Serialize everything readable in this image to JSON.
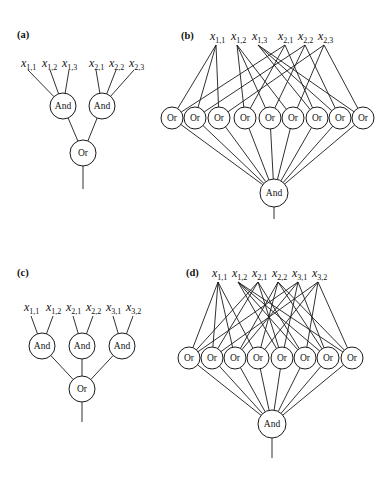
{
  "colors": {
    "stroke": "#1a1a1a",
    "background": "#ffffff"
  },
  "panels": [
    {
      "id": "a",
      "label": "(a)",
      "label_pos": [
        17,
        38
      ],
      "variables": [
        {
          "name": "x",
          "sub": "1,1",
          "text_x": 21,
          "text_y": 67,
          "anchor": [
            28,
            70
          ]
        },
        {
          "name": "x",
          "sub": "1,2",
          "text_x": 42,
          "text_y": 67,
          "anchor": [
            50,
            70
          ]
        },
        {
          "name": "x",
          "sub": "1,3",
          "text_x": 62,
          "text_y": 67,
          "anchor": [
            69,
            70
          ]
        },
        {
          "name": "x",
          "sub": "2,1",
          "text_x": 89,
          "text_y": 67,
          "anchor": [
            96,
            70
          ]
        },
        {
          "name": "x",
          "sub": "2,2",
          "text_x": 109,
          "text_y": 67,
          "anchor": [
            116,
            70
          ]
        },
        {
          "name": "x",
          "sub": "2,3",
          "text_x": 129,
          "text_y": 67,
          "anchor": [
            134,
            70
          ]
        }
      ],
      "middle": {
        "label": "And",
        "r": 13,
        "y": 106,
        "xs": [
          63,
          102
        ]
      },
      "middle_inputs": [
        [
          0,
          1,
          2
        ],
        [
          3,
          4,
          5
        ]
      ],
      "root": {
        "label": "Or",
        "r": 13,
        "x": 83,
        "y": 153,
        "stem_end": 189
      }
    },
    {
      "id": "b",
      "label": "(b)",
      "label_pos": [
        181,
        39
      ],
      "variables": [
        {
          "name": "x",
          "sub": "1,1",
          "text_x": 210,
          "text_y": 40,
          "anchor": [
            216,
            45
          ]
        },
        {
          "name": "x",
          "sub": "1,2",
          "text_x": 231,
          "text_y": 40,
          "anchor": [
            237,
            45
          ]
        },
        {
          "name": "x",
          "sub": "1,3",
          "text_x": 252,
          "text_y": 40,
          "anchor": [
            258,
            45
          ]
        },
        {
          "name": "x",
          "sub": "2,1",
          "text_x": 278,
          "text_y": 40,
          "anchor": [
            285,
            45
          ]
        },
        {
          "name": "x",
          "sub": "2,2",
          "text_x": 298,
          "text_y": 40,
          "anchor": [
            305,
            45
          ]
        },
        {
          "name": "x",
          "sub": "2,3",
          "text_x": 318,
          "text_y": 40,
          "anchor": [
            324,
            45
          ]
        }
      ],
      "middle": {
        "label": "Or",
        "r": 11,
        "y": 118,
        "xs": [
          172,
          195,
          219,
          245,
          270,
          293,
          317,
          340,
          363
        ]
      },
      "middle_inputs": [
        [
          0,
          3
        ],
        [
          0,
          4
        ],
        [
          0,
          5
        ],
        [
          1,
          3
        ],
        [
          1,
          4
        ],
        [
          1,
          5
        ],
        [
          2,
          3
        ],
        [
          2,
          4
        ],
        [
          2,
          5
        ]
      ],
      "root": {
        "label": "And",
        "r": 14,
        "x": 274,
        "y": 193,
        "stem_end": 219
      }
    },
    {
      "id": "c",
      "label": "(c)",
      "label_pos": [
        17,
        276
      ],
      "variables": [
        {
          "name": "x",
          "sub": "1,1",
          "text_x": 24,
          "text_y": 311,
          "anchor": [
            31,
            316
          ]
        },
        {
          "name": "x",
          "sub": "1,2",
          "text_x": 46,
          "text_y": 311,
          "anchor": [
            53,
            316
          ]
        },
        {
          "name": "x",
          "sub": "2,1",
          "text_x": 66,
          "text_y": 311,
          "anchor": [
            73,
            316
          ]
        },
        {
          "name": "x",
          "sub": "2,2",
          "text_x": 86,
          "text_y": 311,
          "anchor": [
            93,
            316
          ]
        },
        {
          "name": "x",
          "sub": "3,1",
          "text_x": 106,
          "text_y": 311,
          "anchor": [
            113,
            316
          ]
        },
        {
          "name": "x",
          "sub": "3,2",
          "text_x": 126,
          "text_y": 311,
          "anchor": [
            133,
            316
          ]
        }
      ],
      "middle": {
        "label": "And",
        "r": 13,
        "y": 346,
        "xs": [
          42,
          82,
          122
        ]
      },
      "middle_inputs": [
        [
          0,
          1
        ],
        [
          2,
          3
        ],
        [
          4,
          5
        ]
      ],
      "root": {
        "label": "Or",
        "r": 13,
        "x": 82,
        "y": 389,
        "stem_end": 422
      }
    },
    {
      "id": "d",
      "label": "(d)",
      "label_pos": [
        186,
        276
      ],
      "variables": [
        {
          "name": "x",
          "sub": "1,1",
          "text_x": 212,
          "text_y": 277,
          "anchor": [
            218,
            282
          ]
        },
        {
          "name": "x",
          "sub": "1,2",
          "text_x": 232,
          "text_y": 277,
          "anchor": [
            238,
            282
          ]
        },
        {
          "name": "x",
          "sub": "2,1",
          "text_x": 252,
          "text_y": 277,
          "anchor": [
            258,
            282
          ]
        },
        {
          "name": "x",
          "sub": "2,2",
          "text_x": 272,
          "text_y": 277,
          "anchor": [
            278,
            282
          ]
        },
        {
          "name": "x",
          "sub": "3,1",
          "text_x": 292,
          "text_y": 277,
          "anchor": [
            298,
            282
          ]
        },
        {
          "name": "x",
          "sub": "3,2",
          "text_x": 312,
          "text_y": 277,
          "anchor": [
            318,
            282
          ]
        }
      ],
      "middle": {
        "label": "Or",
        "r": 11,
        "y": 358,
        "xs": [
          189,
          212,
          235,
          258,
          282,
          305,
          328,
          352
        ]
      },
      "middle_inputs": [
        [
          0,
          2,
          4
        ],
        [
          0,
          2,
          5
        ],
        [
          0,
          3,
          4
        ],
        [
          0,
          3,
          5
        ],
        [
          1,
          2,
          4
        ],
        [
          1,
          2,
          5
        ],
        [
          1,
          3,
          4
        ],
        [
          1,
          3,
          5
        ]
      ],
      "root": {
        "label": "And",
        "r": 14,
        "x": 272,
        "y": 424,
        "stem_end": 458
      }
    }
  ]
}
